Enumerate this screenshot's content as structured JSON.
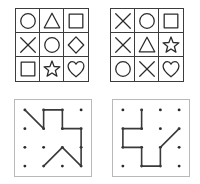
{
  "canvas": {
    "width": 200,
    "height": 184,
    "background": "#ffffff"
  },
  "colors": {
    "shape_stroke": "#2b2b2b",
    "grid_line": "#3c3c3c",
    "panel_border": "#b9b9b9",
    "dot_fill": "#2b2b2b",
    "path_stroke": "#3a3a3a"
  },
  "panels": {
    "shapes_left": {
      "name": "shape-grid-left",
      "rows": 3,
      "cols": 3,
      "cells": [
        {
          "shape": "circle",
          "row": 0,
          "col": 0
        },
        {
          "shape": "triangle",
          "row": 0,
          "col": 1
        },
        {
          "shape": "square",
          "row": 0,
          "col": 2
        },
        {
          "shape": "cross",
          "row": 1,
          "col": 0
        },
        {
          "shape": "circle",
          "row": 1,
          "col": 1
        },
        {
          "shape": "diamond",
          "row": 1,
          "col": 2
        },
        {
          "shape": "square",
          "row": 2,
          "col": 0
        },
        {
          "shape": "star",
          "row": 2,
          "col": 1
        },
        {
          "shape": "heart",
          "row": 2,
          "col": 2
        }
      ]
    },
    "shapes_right": {
      "name": "shape-grid-right",
      "rows": 3,
      "cols": 3,
      "cells": [
        {
          "shape": "cross",
          "row": 0,
          "col": 0
        },
        {
          "shape": "circle",
          "row": 0,
          "col": 1
        },
        {
          "shape": "square",
          "row": 0,
          "col": 2
        },
        {
          "shape": "cross",
          "row": 1,
          "col": 0
        },
        {
          "shape": "triangle",
          "row": 1,
          "col": 1
        },
        {
          "shape": "star",
          "row": 1,
          "col": 2
        },
        {
          "shape": "circle",
          "row": 2,
          "col": 0
        },
        {
          "shape": "cross",
          "row": 2,
          "col": 1
        },
        {
          "shape": "heart",
          "row": 2,
          "col": 2
        }
      ]
    },
    "path_left": {
      "name": "dot-lattice-left",
      "lattice": {
        "rows": 4,
        "cols": 4
      },
      "path_points": [
        [
          0,
          0
        ],
        [
          1,
          1
        ],
        [
          1,
          0
        ],
        [
          2,
          0
        ],
        [
          2,
          1
        ],
        [
          3,
          1
        ],
        [
          3,
          3
        ],
        [
          2,
          2
        ],
        [
          1,
          3
        ]
      ]
    },
    "path_right": {
      "name": "dot-lattice-right",
      "lattice": {
        "rows": 4,
        "cols": 4
      },
      "path_points": [
        [
          1,
          0
        ],
        [
          1,
          1
        ],
        [
          0,
          1
        ],
        [
          0,
          2
        ],
        [
          1,
          2
        ],
        [
          1,
          3
        ],
        [
          2,
          3
        ],
        [
          2,
          2
        ],
        [
          3,
          1
        ]
      ]
    }
  }
}
